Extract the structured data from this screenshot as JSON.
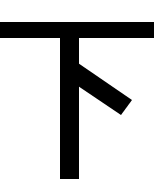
{
  "character": {
    "glyph": "下",
    "meaning": "down",
    "stroke_color": "#000000",
    "background_color": "#ffffff"
  }
}
